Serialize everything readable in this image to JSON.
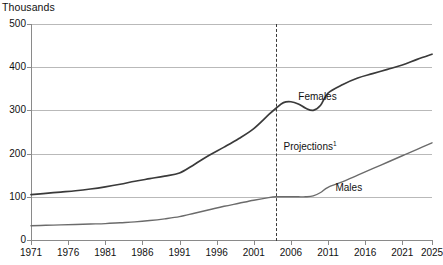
{
  "chart_data": {
    "type": "line",
    "title": "",
    "subtitle": "",
    "unit_label": "Thousands",
    "xlabel": "",
    "ylabel": "",
    "xlim": [
      1971,
      2025
    ],
    "ylim": [
      0,
      500
    ],
    "grid": true,
    "legend_position": "inline-annotations",
    "y_ticks": [
      0,
      100,
      200,
      300,
      400,
      500
    ],
    "y_tick_labels": [
      "0",
      "100",
      "200",
      "300",
      "400",
      "500"
    ],
    "x_ticks": [
      1971,
      1976,
      1981,
      1986,
      1991,
      1996,
      2001,
      2006,
      2011,
      2016,
      2021,
      2025
    ],
    "x_tick_labels": [
      "1971",
      "1976",
      "1981",
      "1986",
      "1991",
      "1996",
      "2001",
      "2006",
      "2011",
      "2016",
      "2021",
      "2025"
    ],
    "annotations": [
      {
        "name": "females-label",
        "text": "Females",
        "x": 2007,
        "y": 330
      },
      {
        "name": "males-label",
        "text": "Males",
        "x": 2012,
        "y": 120
      },
      {
        "name": "projections-label",
        "text": "Projections",
        "superscript": "1",
        "x": 2005,
        "y": 218
      }
    ],
    "projection_divider": {
      "year": 2004,
      "style": "dashed",
      "color": "#3a3a3a"
    },
    "series": [
      {
        "name": "Females",
        "color": "#3a3a3a",
        "x": [
          1971,
          1973,
          1975,
          1977,
          1979,
          1981,
          1983,
          1985,
          1987,
          1989,
          1991,
          1993,
          1995,
          1997,
          1999,
          2001,
          2003,
          2004,
          2005,
          2006,
          2007,
          2008,
          2009,
          2010,
          2011,
          2013,
          2015,
          2017,
          2019,
          2021,
          2023,
          2025
        ],
        "values": [
          105,
          108,
          111,
          114,
          118,
          123,
          129,
          136,
          142,
          148,
          155,
          175,
          196,
          215,
          235,
          258,
          290,
          305,
          318,
          320,
          315,
          305,
          300,
          312,
          340,
          360,
          375,
          385,
          395,
          405,
          418,
          430
        ]
      },
      {
        "name": "Males",
        "color": "#6b6b6b",
        "x": [
          1971,
          1973,
          1975,
          1977,
          1979,
          1981,
          1983,
          1985,
          1987,
          1989,
          1991,
          1993,
          1995,
          1997,
          1999,
          2001,
          2003,
          2004,
          2005,
          2006,
          2007,
          2008,
          2009,
          2010,
          2011,
          2013,
          2015,
          2017,
          2019,
          2021,
          2023,
          2025
        ],
        "values": [
          33,
          34,
          35,
          36,
          37,
          38,
          40,
          42,
          45,
          49,
          54,
          62,
          70,
          78,
          85,
          92,
          98,
          100,
          100,
          100,
          100,
          100,
          102,
          110,
          122,
          135,
          150,
          165,
          180,
          195,
          210,
          225
        ]
      }
    ]
  }
}
